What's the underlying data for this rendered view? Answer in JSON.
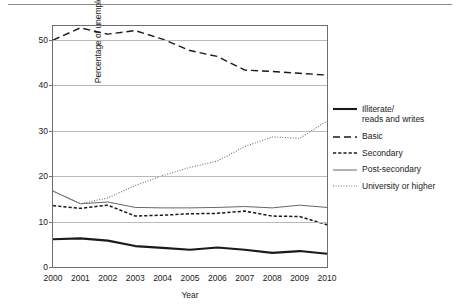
{
  "chart_data": {
    "type": "line",
    "title": "",
    "xlabel": "Year",
    "ylabel": "Percentage of unemployed",
    "categories": [
      "2000",
      "2001",
      "2002",
      "2003",
      "2004",
      "2005",
      "2006",
      "2007",
      "2008",
      "2009",
      "2010"
    ],
    "x": [
      2000,
      2001,
      2002,
      2003,
      2004,
      2005,
      2006,
      2007,
      2008,
      2009,
      2010
    ],
    "xlim": [
      2000,
      2010
    ],
    "ylim": [
      0,
      53
    ],
    "yticks": [
      0,
      10,
      20,
      30,
      40,
      50
    ],
    "ytick_labels": [
      "0",
      "10",
      "20",
      "30",
      "40",
      "50"
    ],
    "grid": "horizontal",
    "legend_position": "right",
    "series": [
      {
        "name": "Illiterate/\nreads and writes",
        "style": "solid-thick",
        "color": "#1a1a1a",
        "values": [
          6.1,
          6.3,
          5.8,
          4.6,
          4.2,
          3.8,
          4.3,
          3.8,
          3.1,
          3.5,
          2.9
        ]
      },
      {
        "name": "Basic",
        "style": "long-dash",
        "color": "#1a1a1a",
        "values": [
          49.9,
          52.6,
          51.2,
          52.0,
          50.1,
          47.6,
          46.3,
          43.3,
          43.0,
          42.6,
          42.2
        ]
      },
      {
        "name": "Secondary",
        "style": "short-dash",
        "color": "#1a1a1a",
        "values": [
          13.5,
          12.9,
          13.6,
          11.2,
          11.4,
          11.7,
          11.8,
          12.3,
          11.2,
          11.1,
          9.3
        ]
      },
      {
        "name": "Post-secondary",
        "style": "solid-thin",
        "color": "#4a4a4a",
        "values": [
          16.7,
          13.9,
          14.3,
          13.1,
          13.0,
          13.0,
          13.1,
          13.3,
          13.0,
          13.6,
          13.1
        ]
      },
      {
        "name": "University or higher",
        "style": "dotted",
        "color": "#6e6e6e",
        "values": [
          16.7,
          13.9,
          15.2,
          17.9,
          20.1,
          21.9,
          23.3,
          26.5,
          28.6,
          28.3,
          32.1
        ]
      }
    ]
  },
  "axes": {
    "ylabel": "Percentage of unemployed",
    "xlabel": "Year",
    "yticks": [
      "0",
      "10",
      "20",
      "30",
      "40",
      "50"
    ],
    "xticks": [
      "2000",
      "2001",
      "2002",
      "2003",
      "2004",
      "2005",
      "2006",
      "2007",
      "2008",
      "2009",
      "2010"
    ]
  },
  "legend": {
    "items": [
      {
        "label": "Illiterate/\nreads and writes",
        "style": "solid-thick"
      },
      {
        "label": "Basic",
        "style": "long-dash"
      },
      {
        "label": "Secondary",
        "style": "short-dash"
      },
      {
        "label": "Post-secondary",
        "style": "solid-thin"
      },
      {
        "label": "University or higher",
        "style": "dotted"
      }
    ]
  }
}
